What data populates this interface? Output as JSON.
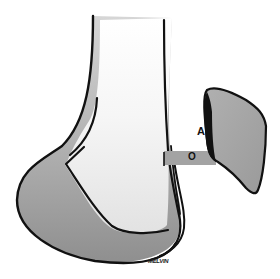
{
  "diagram": {
    "type": "medical-anatomical-illustration",
    "labels": {
      "a": "A",
      "o": "O"
    },
    "signature": "MELVIN",
    "colors": {
      "outline": "#111111",
      "bone_fill_light": "#f2f2f2",
      "bone_fill_dark": "#9a9a9a",
      "graft_fill": "#a6a6a6",
      "connector_fill": "#a3a3a3",
      "background": "#ffffff"
    }
  }
}
